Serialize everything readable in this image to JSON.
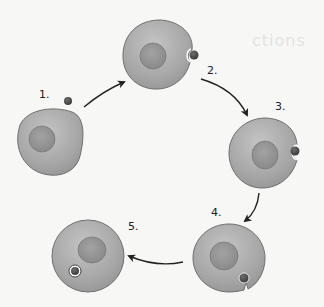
{
  "background_bleed": {
    "heading": "ctions",
    "lines": [
      "",
      "",
      "",
      "",
      "",
      ""
    ]
  },
  "colors": {
    "cell_fill": "#a9a9a9",
    "cell_stroke": "#6f6f6f",
    "nucleus_fill": "#8f8f8f",
    "particle_fill": "#4a4a4a",
    "arrow": "#222222",
    "background": "#f7f7f5"
  },
  "steps": [
    {
      "label": "1.",
      "description": "Particle approaches cell"
    },
    {
      "label": "2.",
      "description": "Particle binds to cell membrane"
    },
    {
      "label": "3.",
      "description": "Membrane invaginates around particle"
    },
    {
      "label": "4.",
      "description": "Particle is engulfed"
    },
    {
      "label": "5.",
      "description": "Particle enclosed in vesicle inside cell"
    }
  ],
  "arrows": [
    {
      "from": "1.",
      "to": "2."
    },
    {
      "from": "2.",
      "to": "3."
    },
    {
      "from": "3.",
      "to": "4."
    },
    {
      "from": "4.",
      "to": "5."
    }
  ]
}
